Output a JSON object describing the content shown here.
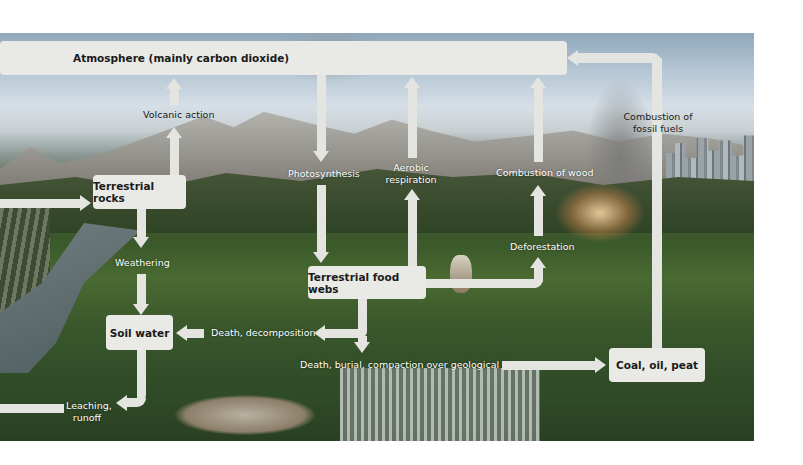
{
  "diagram": {
    "colors": {
      "box_fill": "#e9e9e6",
      "arrow_fill": "#e4e4e1",
      "box_text": "#1a1a1a",
      "label_text": "#ffffff",
      "background": "#ffffff"
    },
    "boxes": {
      "atmosphere": "Atmosphere (mainly carbon dioxide)",
      "terrestrial_rocks": "Terrestrial rocks",
      "soil_water": "Soil water",
      "food_webs": "Terrestrial food webs",
      "coal": "Coal, oil, peat"
    },
    "processes": {
      "volcanic": "Volcanic action",
      "weathering": "Weathering",
      "photosynthesis": "Photosynthesis",
      "aerobic_1": "Aerobic",
      "aerobic_2": "respiration",
      "combustion_wood": "Combustion of wood",
      "deforestation": "Deforestation",
      "fossil_1": "Combustion of",
      "fossil_2": "fossil fuels",
      "decomposition": "Death, decomposition",
      "burial": "Death, burial, compaction over geological time",
      "leaching_1": "Leaching,",
      "leaching_2": "runoff"
    },
    "flows": [
      {
        "from": "Terrestrial rocks",
        "to": "Atmosphere (mainly carbon dioxide)",
        "label": "Volcanic action"
      },
      {
        "from": "Terrestrial rocks",
        "to": "Soil water",
        "label": "Weathering"
      },
      {
        "from": "Atmosphere (mainly carbon dioxide)",
        "to": "Terrestrial food webs",
        "label": "Photosynthesis"
      },
      {
        "from": "Terrestrial food webs",
        "to": "Atmosphere (mainly carbon dioxide)",
        "label": "Aerobic respiration"
      },
      {
        "from": "Terrestrial food webs",
        "to": "Deforestation",
        "label": ""
      },
      {
        "from": "Deforestation",
        "to": "Atmosphere (mainly carbon dioxide)",
        "label": "Combustion of wood"
      },
      {
        "from": "Terrestrial food webs",
        "to": "Soil water",
        "label": "Death, decomposition"
      },
      {
        "from": "Terrestrial food webs",
        "to": "Coal, oil, peat",
        "label": "Death, burial, compaction over geological time"
      },
      {
        "from": "Coal, oil, peat",
        "to": "Atmosphere (mainly carbon dioxide)",
        "label": "Combustion of fossil fuels"
      },
      {
        "from": "Soil water",
        "to": "off-diagram (left)",
        "label": "Leaching, runoff"
      },
      {
        "from": "off-diagram (left)",
        "to": "Terrestrial rocks",
        "label": ""
      }
    ]
  }
}
